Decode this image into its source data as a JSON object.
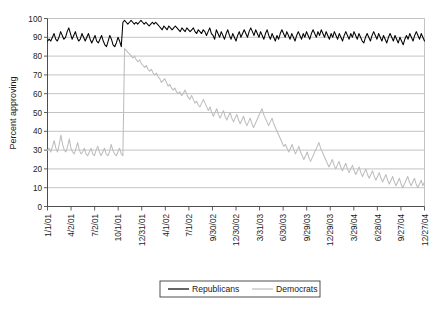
{
  "chart_data": {
    "type": "line",
    "title": "",
    "xlabel": "",
    "ylabel": "Percent approving",
    "ylim": [
      0,
      100
    ],
    "ytick_step": 10,
    "yticks": [
      "0",
      "10",
      "20",
      "30",
      "40",
      "50",
      "60",
      "70",
      "80",
      "90",
      "100"
    ],
    "grid": true,
    "legend_position": "bottom-center",
    "xticks": [
      "1/1/01",
      "4/2/01",
      "7/2/01",
      "10/1/01",
      "12/31/01",
      "4/1/02",
      "7/1/02",
      "9/30/02",
      "12/30/02",
      "3/31/03",
      "6/30/03",
      "9/29/03",
      "12/29/03",
      "3/29/04",
      "6/28/04",
      "9/27/04",
      "12/27/04"
    ],
    "x_range": [
      "1/1/01",
      "12/27/04"
    ],
    "colors": {
      "republicans": "#000000",
      "democrats": "#bdbdbd",
      "gridline": "#b4b4b4",
      "axis": "#4d4d4d"
    },
    "series": [
      {
        "name": "Republicans",
        "color": "#000000",
        "values": [
          88,
          89,
          88,
          90,
          92,
          89,
          88,
          90,
          93,
          91,
          89,
          90,
          93,
          95,
          92,
          89,
          91,
          93,
          90,
          88,
          89,
          92,
          90,
          88,
          90,
          92,
          89,
          87,
          89,
          91,
          88,
          87,
          89,
          91,
          88,
          86,
          85,
          88,
          91,
          89,
          86,
          85,
          87,
          90,
          88,
          85,
          98,
          99,
          98,
          97,
          98,
          99,
          98,
          97,
          98,
          97,
          98,
          99,
          98,
          97,
          98,
          97,
          96,
          97,
          98,
          97,
          98,
          97,
          96,
          95,
          94,
          96,
          95,
          94,
          96,
          95,
          94,
          95,
          96,
          95,
          94,
          93,
          95,
          94,
          93,
          95,
          94,
          93,
          94,
          95,
          93,
          92,
          94,
          93,
          92,
          94,
          93,
          91,
          93,
          95,
          92,
          91,
          89,
          94,
          92,
          90,
          93,
          91,
          89,
          92,
          94,
          91,
          89,
          92,
          90,
          88,
          91,
          93,
          90,
          92,
          94,
          92,
          90,
          93,
          95,
          93,
          91,
          94,
          92,
          90,
          93,
          91,
          89,
          92,
          94,
          91,
          89,
          92,
          90,
          88,
          91,
          89,
          92,
          94,
          92,
          90,
          93,
          91,
          89,
          92,
          90,
          88,
          91,
          93,
          91,
          89,
          92,
          90,
          93,
          91,
          89,
          92,
          94,
          92,
          90,
          93,
          91,
          94,
          92,
          90,
          93,
          91,
          89,
          92,
          90,
          93,
          91,
          89,
          92,
          90,
          88,
          91,
          93,
          91,
          89,
          92,
          90,
          93,
          91,
          89,
          92,
          90,
          88,
          87,
          90,
          92,
          90,
          88,
          91,
          93,
          91,
          89,
          92,
          90,
          88,
          91,
          89,
          87,
          90,
          92,
          90,
          88,
          91,
          89,
          87,
          90,
          88,
          86,
          89,
          91,
          89,
          92,
          90,
          88,
          91,
          93,
          91,
          89,
          92,
          90,
          88
        ]
      },
      {
        "name": "Democrats",
        "color": "#bdbdbd",
        "values": [
          30,
          31,
          29,
          32,
          35,
          31,
          29,
          33,
          38,
          33,
          30,
          29,
          32,
          36,
          31,
          29,
          28,
          31,
          34,
          30,
          28,
          29,
          31,
          28,
          27,
          29,
          31,
          28,
          27,
          30,
          32,
          29,
          27,
          29,
          31,
          28,
          27,
          29,
          33,
          30,
          28,
          27,
          29,
          31,
          28,
          27,
          84,
          83,
          82,
          81,
          80,
          79,
          80,
          78,
          77,
          78,
          76,
          75,
          74,
          75,
          73,
          72,
          73,
          71,
          70,
          71,
          69,
          68,
          66,
          67,
          68,
          66,
          64,
          65,
          63,
          62,
          63,
          61,
          60,
          61,
          59,
          60,
          62,
          60,
          58,
          57,
          59,
          57,
          55,
          56,
          54,
          53,
          55,
          57,
          55,
          53,
          51,
          53,
          50,
          48,
          50,
          52,
          49,
          47,
          49,
          51,
          48,
          46,
          48,
          50,
          47,
          45,
          47,
          49,
          46,
          44,
          46,
          48,
          45,
          43,
          45,
          47,
          44,
          42,
          44,
          46,
          48,
          50,
          52,
          49,
          47,
          45,
          43,
          45,
          47,
          44,
          42,
          40,
          38,
          36,
          34,
          32,
          33,
          31,
          29,
          31,
          33,
          30,
          28,
          30,
          32,
          29,
          27,
          25,
          27,
          29,
          26,
          24,
          26,
          28,
          30,
          32,
          34,
          31,
          29,
          27,
          25,
          23,
          21,
          23,
          25,
          22,
          20,
          22,
          24,
          21,
          19,
          21,
          23,
          20,
          18,
          20,
          22,
          19,
          17,
          19,
          21,
          18,
          16,
          18,
          20,
          17,
          15,
          17,
          19,
          16,
          14,
          16,
          18,
          15,
          13,
          15,
          17,
          14,
          12,
          14,
          16,
          13,
          11,
          13,
          15,
          12,
          10,
          12,
          14,
          16,
          13,
          11,
          13,
          15,
          12,
          10,
          12,
          14,
          11,
          13
        ]
      }
    ]
  },
  "legend": {
    "items": [
      {
        "label": "Republicans",
        "color": "#000000"
      },
      {
        "label": "Democrats",
        "color": "#bdbdbd"
      }
    ]
  }
}
